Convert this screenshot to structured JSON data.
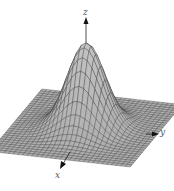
{
  "chart_data": {
    "type": "surface",
    "title": "",
    "function": "z = exp(-(x^2 + y^2))",
    "xlabel": "x",
    "ylabel": "y",
    "zlabel": "z",
    "grid": true,
    "surface_color": "#b0b0b0",
    "mesh_color": "#3a3a3a",
    "peak": {
      "x": 0,
      "y": 0,
      "z": 1
    }
  },
  "axes": {
    "x_label": "x",
    "y_label": "y",
    "z_label": "z"
  }
}
